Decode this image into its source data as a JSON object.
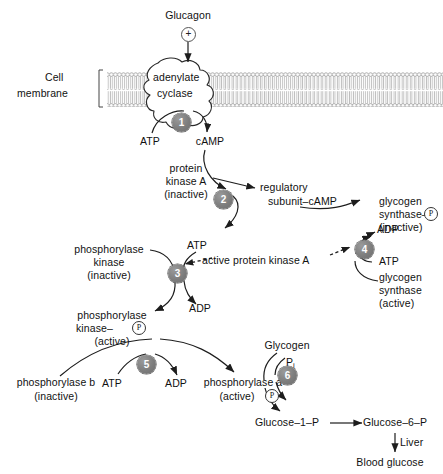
{
  "diagram": {
    "colors": {
      "step_circle": "#7d7d7d",
      "line": "#222222",
      "membrane": "#b5b5b5",
      "text": "#111111"
    }
  },
  "labels": {
    "glucagon": "Glucagon",
    "plus_sign": "+",
    "cell_membrane_line1": "Cell",
    "cell_membrane_line2": "membrane",
    "adenylate": "adenylate",
    "cyclase": "cyclase",
    "atp_1": "ATP",
    "camp": "cAMP",
    "protein_kinase_a_l1": "protein",
    "protein_kinase_a_l2": "kinase A",
    "protein_kinase_a_l3": "(inactive)",
    "regulatory_l1": "regulatory",
    "regulatory_l2": "subunit–cAMP",
    "active_pka": "active protein kinase A",
    "atp_2": "ATP",
    "phos_kinase_inactive_l1": "phosphorylase",
    "phos_kinase_inactive_l2": "kinase",
    "phos_kinase_inactive_l3": "(inactive)",
    "adp_2": "ADP",
    "phos_kinase_active_l1": "phosphorylase",
    "phos_kinase_active_l2": "kinase–",
    "phos_kinase_active_p": "P",
    "phos_kinase_active_l3": "(active)",
    "adp_4": "ADP",
    "atp_4": "ATP",
    "glycogen_synthase_inactive_l1": "glycogen",
    "glycogen_synthase_inactive_l2": "synthase–",
    "glycogen_synthase_inactive_p": "P",
    "glycogen_synthase_inactive_l3": "(inactive)",
    "glycogen_synthase_active_l1": "glycogen",
    "glycogen_synthase_active_l2": "synthase",
    "glycogen_synthase_active_l3": "(active)",
    "phosphorylase_b_l1": "phosphorylase b",
    "phosphorylase_b_l2": "(inactive)",
    "atp_5": "ATP",
    "adp_5": "ADP",
    "phosphorylase_a_l1": "phosphorylase a",
    "phosphorylase_a_l2": "(active)",
    "phosphorylase_a_p": "P",
    "glycogen": "Glycogen",
    "pi_main": "P",
    "pi_sub": "i",
    "glucose_1_p": "Glucose–1–P",
    "glucose_6_p": "Glucose–6–P",
    "liver": "Liver",
    "blood_glucose": "Blood glucose"
  },
  "steps": [
    {
      "id": "1",
      "number": "1"
    },
    {
      "id": "2",
      "number": "2"
    },
    {
      "id": "3",
      "number": "3"
    },
    {
      "id": "4",
      "number": "4"
    },
    {
      "id": "5",
      "number": "5"
    },
    {
      "id": "6",
      "number": "6"
    }
  ]
}
